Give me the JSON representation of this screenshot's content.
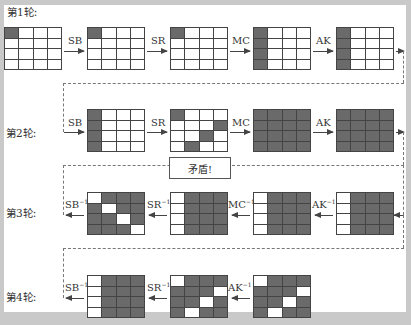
{
  "rounds": [
    {
      "label": "第1轮:"
    },
    {
      "label": "第2轮:"
    },
    {
      "label": "第3轮:"
    },
    {
      "label": "第4轮:"
    }
  ],
  "ops": {
    "r1": [
      "SB",
      "SR",
      "MC",
      "AK"
    ],
    "r2": [
      "SB",
      "SR",
      "MC",
      "AK"
    ],
    "r3": [
      "SB",
      "SR",
      "MC",
      "AK"
    ],
    "r4": [
      "SB",
      "SR",
      "AK"
    ],
    "inv_suffix": "−1"
  },
  "conflict_label": "矛盾!",
  "colors": {
    "filled": "#6a6a6a",
    "empty": "#ffffff",
    "line": "#444444",
    "frame": "#c9c9c9"
  },
  "grids": {
    "r1": [
      [
        "1000",
        "0000",
        "0000",
        "0000"
      ],
      [
        "1000",
        "0000",
        "0000",
        "0000"
      ],
      [
        "1000",
        "0000",
        "0000",
        "0000"
      ],
      [
        "1000",
        "1000",
        "1000",
        "1000"
      ],
      [
        "1000",
        "1000",
        "1000",
        "1000"
      ]
    ],
    "r2": [
      [
        "1000",
        "1000",
        "1000",
        "1000"
      ],
      [
        "1000",
        "0001",
        "0010",
        "0100"
      ],
      [
        "1111",
        "1111",
        "1111",
        "1111"
      ],
      [
        "1111",
        "1111",
        "1111",
        "1111"
      ]
    ],
    "r3": [
      [
        "0111",
        "1011",
        "1101",
        "1110"
      ],
      [
        "0111",
        "0111",
        "0111",
        "0111"
      ],
      [
        "0111",
        "0111",
        "0111",
        "0111"
      ],
      [
        "0111",
        "0111",
        "0111",
        "0111"
      ]
    ],
    "r4": [
      [
        "0111",
        "0111",
        "0111",
        "0111"
      ],
      [
        "0111",
        "1110",
        "1101",
        "1011"
      ],
      [
        "0111",
        "1110",
        "1101",
        "1011"
      ]
    ]
  }
}
